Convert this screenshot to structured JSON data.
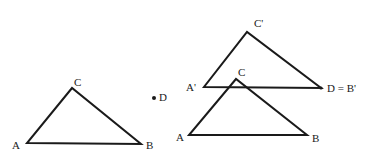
{
  "diagram": {
    "stroke_color": "#1a1a1a",
    "background": "#ffffff",
    "left_figure": {
      "triangle_ABC": {
        "vertices": {
          "A": {
            "x": 27,
            "y": 143,
            "label": "A",
            "label_x": 12,
            "label_y": 140
          },
          "B": {
            "x": 141,
            "y": 144,
            "label": "B",
            "label_x": 146,
            "label_y": 140
          },
          "C": {
            "x": 72,
            "y": 88,
            "label": "C",
            "label_x": 74,
            "label_y": 77
          }
        }
      },
      "point_D": {
        "x": 154,
        "y": 98,
        "label": "D",
        "label_x": 159,
        "label_y": 92
      }
    },
    "right_figure": {
      "triangle_ABC": {
        "vertices": {
          "A": {
            "x": 189,
            "y": 135,
            "label": "A",
            "label_x": 176,
            "label_y": 132
          },
          "B": {
            "x": 307,
            "y": 135,
            "label": "B",
            "label_x": 312,
            "label_y": 133
          },
          "C": {
            "x": 236,
            "y": 79,
            "label": "C",
            "label_x": 238,
            "label_y": 67
          }
        }
      },
      "triangle_A1B1C1": {
        "vertices": {
          "A_prime": {
            "x": 204,
            "y": 87,
            "label": "A'",
            "label_x": 186,
            "label_y": 82
          },
          "B_prime": {
            "x": 321,
            "y": 88,
            "label": "D = B'",
            "label_x": 327,
            "label_y": 83
          },
          "C_prime": {
            "x": 247,
            "y": 32,
            "label": "C'",
            "label_x": 254,
            "label_y": 18
          }
        }
      }
    }
  }
}
